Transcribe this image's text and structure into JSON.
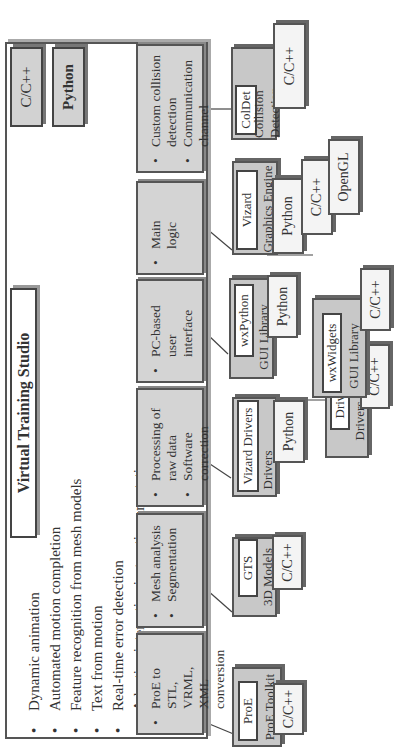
{
  "title": "Virtual Training Studio",
  "legend": {
    "c_cpp": "C/C++",
    "python": "Python"
  },
  "features": [
    "Dynamic animation",
    "Automated motion completion",
    "Feature recognition from mesh models",
    "Text from motion",
    "Real-time error detection",
    "Adaptive interactive instruction annotation"
  ],
  "modules": [
    {
      "items": [
        "ProE to STL, VRML, XML conversion"
      ]
    },
    {
      "items": [
        "Mesh analysis",
        "Segmentation"
      ]
    },
    {
      "items": [
        "Processing of raw data",
        "Software correction"
      ]
    },
    {
      "items": [
        "PC-based user interface"
      ]
    },
    {
      "items": [
        "Main logic"
      ]
    },
    {
      "items": [
        "Custom collision detection",
        "Communication channel"
      ]
    }
  ],
  "components": [
    {
      "name": "ProE",
      "category": "ProE Toolkit",
      "langs": [
        "C/C++"
      ]
    },
    {
      "name": "GTS",
      "category": "3D Models",
      "langs": [
        "C/C++"
      ]
    },
    {
      "name": "Vizard Drivers",
      "category": "Drivers",
      "langs": [
        "Python"
      ]
    },
    {
      "name": "Drivers",
      "category": "Drivers",
      "langs": [
        "C/C++"
      ]
    },
    {
      "name": "wxPython",
      "category": "GUI Library",
      "langs": [
        "Python"
      ]
    },
    {
      "name": "wxWidgets",
      "category": "GUI Library",
      "langs": [
        "C/C++"
      ]
    },
    {
      "name": "Vizard",
      "category": "Graphics Engine",
      "langs": [
        "Python",
        "C/C++",
        "OpenGL"
      ]
    },
    {
      "name": "ColDet",
      "category": "Collision Detection",
      "langs": [
        "C/C++"
      ]
    }
  ],
  "colors": {
    "module_fill": "#d4d4d4",
    "component_fill": "#c8c8c8",
    "language_fill": "#f4f4f4",
    "border": "#555555"
  }
}
